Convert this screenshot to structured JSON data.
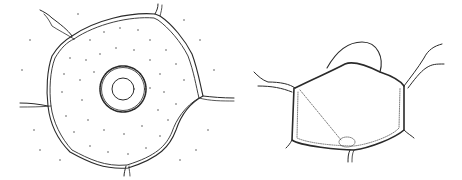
{
  "figure": {
    "panels": [
      {
        "id": "left",
        "subject": "cell-top-view",
        "labels": []
      },
      {
        "id": "right",
        "subject": "cell-cross-section",
        "labels": []
      }
    ],
    "colors": {
      "ink": "#2a2a2a",
      "background": "#ffffff"
    }
  }
}
